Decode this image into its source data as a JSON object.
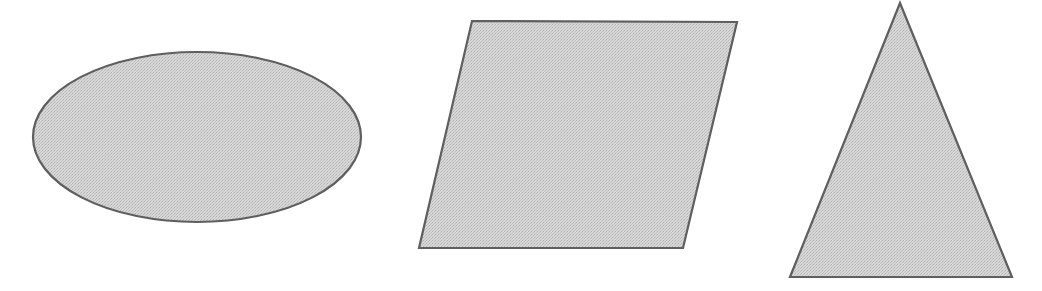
{
  "figure": {
    "background_color": "#ffffff",
    "width": 1042,
    "height": 291,
    "fill_color": "#c9c9c9",
    "fill_texture": "halftone-dither",
    "stroke_color": "#5e5e5e",
    "stroke_width": 2.2,
    "shape_count": 3
  },
  "shapes": [
    {
      "id": "ellipse",
      "name": "Ellipse",
      "type": "ellipse",
      "center_x": 197,
      "center_y": 137,
      "radius_x": 164,
      "radius_y": 85,
      "bounds": {
        "left": 33,
        "top": 52,
        "right": 361,
        "bottom": 222
      },
      "fill_color": "#c9c9c9",
      "stroke_color": "#5e5e5e",
      "stroke_width": 2.2
    },
    {
      "id": "parallelogram",
      "name": "Parallelogram",
      "type": "parallelogram",
      "points": "472,21 737,22 683,248 419,248",
      "vertices": [
        {
          "x": 472,
          "y": 21
        },
        {
          "x": 737,
          "y": 22
        },
        {
          "x": 683,
          "y": 248
        },
        {
          "x": 419,
          "y": 248
        }
      ],
      "bounds": {
        "left": 419,
        "top": 21,
        "right": 737,
        "bottom": 248
      },
      "fill_color": "#c9c9c9",
      "stroke_color": "#5e5e5e",
      "stroke_width": 2.2
    },
    {
      "id": "triangle",
      "name": "Triangle",
      "type": "triangle",
      "points": "900,3 1012,277 790,277",
      "vertices": [
        {
          "x": 900,
          "y": 3
        },
        {
          "x": 1012,
          "y": 277
        },
        {
          "x": 790,
          "y": 277
        }
      ],
      "bounds": {
        "left": 790,
        "top": 3,
        "right": 1012,
        "bottom": 277
      },
      "fill_color": "#c9c9c9",
      "stroke_color": "#5e5e5e",
      "stroke_width": 2.2
    }
  ]
}
